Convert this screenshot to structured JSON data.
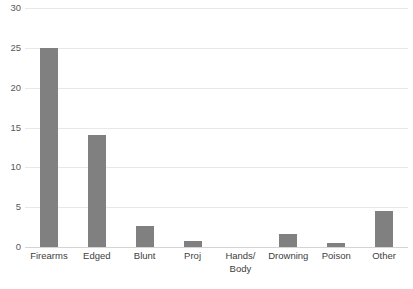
{
  "chart_data": {
    "type": "bar",
    "title": "",
    "subtitle": "",
    "xlabel": "",
    "ylabel": "",
    "categories": [
      "Firearms",
      "Edged",
      "Blunt",
      "Proj",
      "Hands/\nBody",
      "Drowning",
      "Poison",
      "Other"
    ],
    "values": [
      25,
      14,
      2.7,
      0.7,
      0,
      1.6,
      0.5,
      4.5
    ],
    "ylim": [
      0,
      30
    ],
    "yticks": [
      0,
      5,
      10,
      15,
      20,
      25,
      30
    ],
    "ytick_labels": [
      "0",
      "5",
      "10",
      "15",
      "20",
      "25",
      "30"
    ],
    "grid": true,
    "grid_axis": "y",
    "legend": false,
    "legend_position": "none",
    "bar_color": "#808080",
    "gridline_color": "#E8E8E8",
    "axis_line_color": "#D4D4D4",
    "tick_label_color": "#595959",
    "category_label_color": "#404040",
    "background": "#FFFFFF"
  }
}
